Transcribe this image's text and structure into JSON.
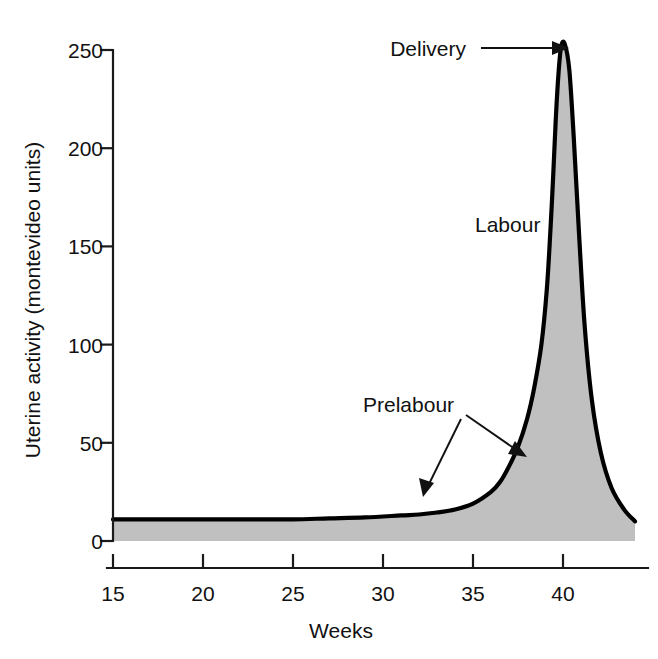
{
  "figure": {
    "background_color": "#ffffff",
    "ink_color": "#111111",
    "fill_color": "#c0c0c0",
    "curve_color": "#000000"
  },
  "chart_data": {
    "type": "area",
    "title": "",
    "xlabel": "Weeks",
    "ylabel": "Uterine activity (montevideo units)",
    "xlim": [
      15,
      44
    ],
    "ylim": [
      0,
      262
    ],
    "xticks": [
      15,
      20,
      25,
      30,
      35,
      40
    ],
    "xticklabels": [
      "15",
      "20",
      "25",
      "30",
      "35",
      "40"
    ],
    "yticks": [
      0,
      50,
      100,
      150,
      200,
      250
    ],
    "yticklabels": [
      "0",
      "50",
      "100",
      "150",
      "200",
      "250"
    ],
    "grid": false,
    "legend": "none",
    "series": [
      {
        "name": "Uterine activity",
        "x": [
          15,
          17,
          19,
          21,
          23,
          25,
          27,
          29,
          31,
          32,
          33,
          34,
          35,
          36,
          36.5,
          37,
          37.5,
          38,
          38.4,
          38.8,
          39.1,
          39.3,
          39.45,
          39.6,
          39.75,
          39.9,
          40.1,
          40.35,
          40.6,
          40.9,
          41.2,
          41.6,
          42.1,
          42.7,
          43.4,
          44
        ],
        "y": [
          11,
          11,
          11,
          11,
          11,
          11,
          11.5,
          12,
          13,
          13.5,
          14.5,
          16,
          19,
          25,
          30,
          38,
          48,
          62,
          78,
          100,
          128,
          158,
          185,
          215,
          238,
          252,
          253,
          240,
          205,
          155,
          110,
          72,
          45,
          27,
          16,
          10
        ]
      }
    ],
    "annotations": [
      {
        "label": "Delivery",
        "target_x": 39.9,
        "target_y": 253,
        "arrow": "right"
      },
      {
        "label": "Labour",
        "target_x": 38.2,
        "target_y": 150,
        "arrow": "none"
      },
      {
        "label": "Prelabour",
        "target_x": 33.6,
        "target_y": 16,
        "arrow": "down-left"
      },
      {
        "label": "Prelabour",
        "target_x": 37.0,
        "target_y": 41,
        "arrow": "down-right"
      }
    ]
  },
  "labels": {
    "y_axis_title": "Uterine activity (montevideo units)",
    "x_axis_title": "Weeks",
    "delivery": "Delivery",
    "labour": "Labour",
    "prelabour": "Prelabour",
    "y_tick_0": "0",
    "y_tick_50": "50",
    "y_tick_100": "100",
    "y_tick_150": "150",
    "y_tick_200": "200",
    "y_tick_250": "250",
    "x_tick_15": "15",
    "x_tick_20": "20",
    "x_tick_25": "25",
    "x_tick_30": "30",
    "x_tick_35": "35",
    "x_tick_40": "40"
  }
}
